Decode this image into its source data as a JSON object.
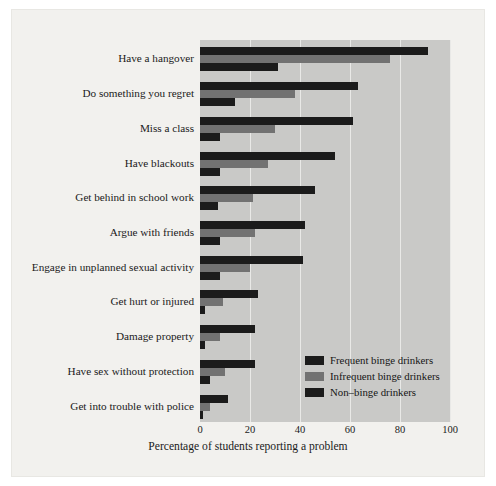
{
  "chart_data": {
    "type": "bar",
    "orientation": "horizontal",
    "title": "",
    "xlabel": "Percentage of students reporting a problem",
    "ylabel": "",
    "xlim": [
      0,
      100
    ],
    "xticks": [
      0,
      20,
      40,
      60,
      80,
      100
    ],
    "xtick_labels": [
      "0",
      "20",
      "40",
      "60",
      "80",
      "100"
    ],
    "grid": true,
    "grid_axis": "x",
    "legend_position": "lower-right-inside",
    "categories": [
      "Have a hangover",
      "Do something you regret",
      "Miss a class",
      "Have blackouts",
      "Get behind in school work",
      "Argue with friends",
      "Engage in unplanned sexual activity",
      "Get hurt or injured",
      "Damage property",
      "Have sex without protection",
      "Get into trouble with police"
    ],
    "series": [
      {
        "name": "Frequent binge drinkers",
        "color": "#1b1b1b",
        "values": [
          91,
          63,
          61,
          54,
          46,
          42,
          41,
          23,
          22,
          22,
          11
        ]
      },
      {
        "name": "Infrequent binge drinkers",
        "color": "#727272",
        "values": [
          76,
          38,
          30,
          27,
          21,
          22,
          20,
          9,
          8,
          10,
          4
        ]
      },
      {
        "name": "Non–binge drinkers",
        "color": "#1b1b1b",
        "values": [
          31,
          14,
          8,
          8,
          7,
          8,
          8,
          2,
          2,
          4,
          1
        ]
      }
    ]
  },
  "legend": {
    "items": [
      "Frequent binge drinkers",
      "Infrequent binge drinkers",
      "Non–binge drinkers"
    ]
  },
  "colors": {
    "page_background": "#f2f1ee",
    "plot_background": "#c9c9c7",
    "gridline": "#e9e9e7",
    "dark_bar": "#1b1b1b",
    "gray_bar": "#727272",
    "text": "#1a1a1a"
  }
}
